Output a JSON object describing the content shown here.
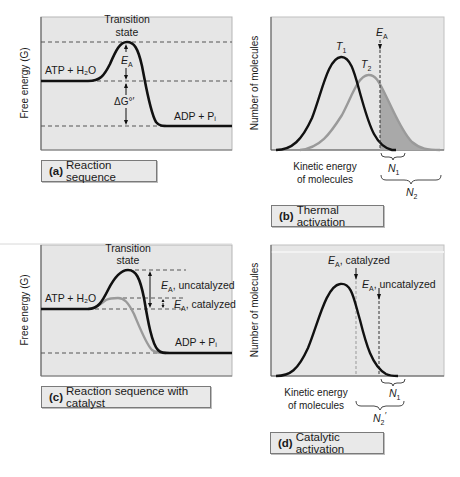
{
  "panels": {
    "a": {
      "caption_letter": "(a)",
      "caption_text": "Reaction sequence",
      "y_axis_label": "Free energy (G)",
      "transition_line1": "Transition",
      "transition_line2": "state",
      "reactant": "ATP + H₂O",
      "product": "ADP + Pᵢ",
      "ea_label": "E",
      "ea_sub": "A",
      "dg_label": "ΔG°′"
    },
    "b": {
      "caption_letter": "(b)",
      "caption_text": "Thermal activation",
      "y_axis_label": "Number of molecules",
      "x_axis_line1": "Kinetic energy",
      "x_axis_line2": "of molecules",
      "t1": "T",
      "t1_sub": "1",
      "t2": "T",
      "t2_sub": "2",
      "ea": "E",
      "ea_sub": "A",
      "n1": "N",
      "n1_sub": "1",
      "n2": "N",
      "n2_sub": "2"
    },
    "c": {
      "caption_letter": "(c)",
      "caption_text": "Reaction sequence with catalyst",
      "y_axis_label": "Free energy (G)",
      "transition_line1": "Transition",
      "transition_line2": "state",
      "reactant": "ATP + H₂O",
      "product": "ADP + Pᵢ",
      "ea_uncat": ", uncatalyzed",
      "ea_cat": ", catalyzed",
      "ea": "E",
      "ea_sub": "A"
    },
    "d": {
      "caption_letter": "(d)",
      "caption_text": "Catalytic activation",
      "y_axis_label": "Number of molecules",
      "x_axis_line1": "Kinetic energy",
      "x_axis_line2": "of molecules",
      "ea_cat": ", catalyzed",
      "ea_uncat": ", uncatalyzed",
      "ea": "E",
      "ea_sub": "A",
      "n1": "N",
      "n1_sub": "1",
      "n2": "N",
      "n2_sub": "2",
      "n2_prime": "′"
    }
  },
  "colors": {
    "panel_bg": "#e6e6e6",
    "curve_dark": "#111111",
    "curve_gray": "#9a9a9a",
    "shade": "#a9a9a9"
  }
}
